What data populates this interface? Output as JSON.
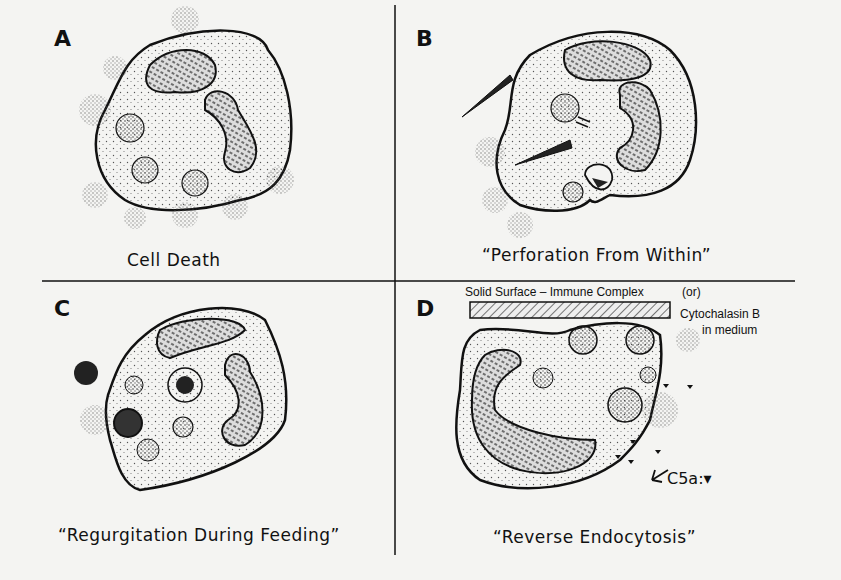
{
  "figure": {
    "panels": [
      {
        "letter": "A",
        "caption": "Cell Death"
      },
      {
        "letter": "B",
        "caption": "“Perforation From Within”"
      },
      {
        "letter": "C",
        "caption": "“Regurgitation During Feeding”"
      },
      {
        "letter": "D",
        "caption": "“Reverse Endocytosis”"
      }
    ],
    "panel_d_labels": {
      "surface": "Solid Surface – Immune Complex",
      "or": "(or)",
      "cytochalasin_line1": "Cytochalasin B",
      "cytochalasin_line2": "in medium",
      "c5a": "C5a:▾"
    },
    "colors": {
      "ink": "#111111",
      "paper": "#f4f4f2",
      "stipple": "#888888"
    }
  }
}
